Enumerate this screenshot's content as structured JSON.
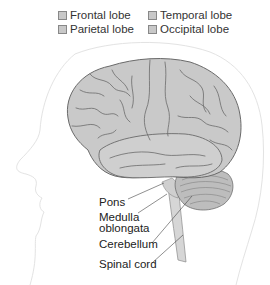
{
  "legend": {
    "items": [
      {
        "label": "Frontal lobe",
        "color": "#c8c8c8"
      },
      {
        "label": "Parietal lobe",
        "color": "#c8c8c8"
      },
      {
        "label": "Temporal lobe",
        "color": "#c8c8c8"
      },
      {
        "label": "Occipital lobe",
        "color": "#c8c8c8"
      }
    ]
  },
  "labels": {
    "pons": "Pons",
    "medulla_line1": "Medulla",
    "medulla_line2": "oblongata",
    "cerebellum": "Cerebellum",
    "spinal_cord": "Spinal cord"
  },
  "colors": {
    "brain_fill": "#c9c9c9",
    "brain_outline": "#6a6a6a",
    "head_outline": "#e2e2e2",
    "cerebellum_fill": "#bdbdbd"
  }
}
